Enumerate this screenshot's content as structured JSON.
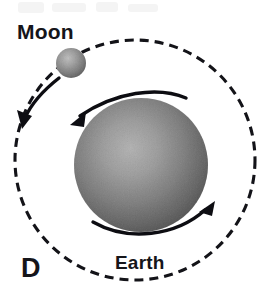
{
  "figure": {
    "panel_letter": "D",
    "background_color": "#ffffff",
    "width": 278,
    "height": 293,
    "ink_color": "#131318",
    "caption_color": "#15151a"
  },
  "labels": {
    "moon": "Moon",
    "earth": "Earth",
    "panel": "D"
  },
  "bodies": {
    "earth": {
      "name": "Earth",
      "center_x": 141,
      "center_y": 165,
      "radius": 67,
      "highlight_color": "#d2d2d2",
      "mid_color": "#b2b2b2",
      "edge_color": "#8e8e8e"
    },
    "moon": {
      "name": "Moon",
      "center_x": 71,
      "center_y": 63,
      "radius": 15,
      "highlight_color": "#d9d9d9",
      "mid_color": "#bdbdbd",
      "edge_color": "#9a9a9a"
    }
  },
  "orbit": {
    "name": "moon-orbit",
    "center_x": 135,
    "center_y": 160,
    "radius": 120,
    "style": "dashed",
    "dash_length": 9,
    "gap_length": 6,
    "stroke_width": 3.1,
    "color": "#131318"
  },
  "arrows": {
    "moon_revolution": {
      "name": "moon-orbit-direction",
      "description": "curved arrow showing Moon revolving counterclockwise along its orbit",
      "direction": "counterclockwise",
      "tip_x": 22,
      "tip_y": 127
    },
    "earth_rotation_top": {
      "name": "earth-rotation-top",
      "description": "curved arrow over the top of Earth pointing left",
      "direction": "counterclockwise",
      "tip_x": 71,
      "tip_y": 124
    },
    "earth_rotation_bottom": {
      "name": "earth-rotation-bottom",
      "description": "curved arrow under the bottom of Earth pointing up and right",
      "direction": "counterclockwise",
      "tip_x": 214,
      "tip_y": 202
    }
  }
}
